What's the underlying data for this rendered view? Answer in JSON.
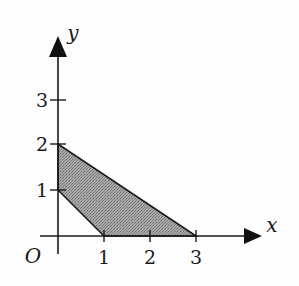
{
  "diagram": {
    "type": "coordinate-plane-region",
    "axes": {
      "x_label": "x",
      "y_label": "y",
      "origin_label": "O",
      "x_ticks": [
        "1",
        "2",
        "3"
      ],
      "y_ticks": [
        "1",
        "2",
        "3"
      ]
    },
    "region": {
      "description": "Shaded quadrilateral bounded by x-axis, y-axis, line x+y=1 and line 2x+3y=6",
      "vertices": [
        [
          0,
          1
        ],
        [
          0,
          2
        ],
        [
          3,
          0
        ],
        [
          1,
          0
        ]
      ],
      "fill_color": "#9a9a9a",
      "stroke_color": "#1a1a1a"
    },
    "colors": {
      "axis": "#1a1a1a",
      "background": "#fdfdfd"
    }
  }
}
